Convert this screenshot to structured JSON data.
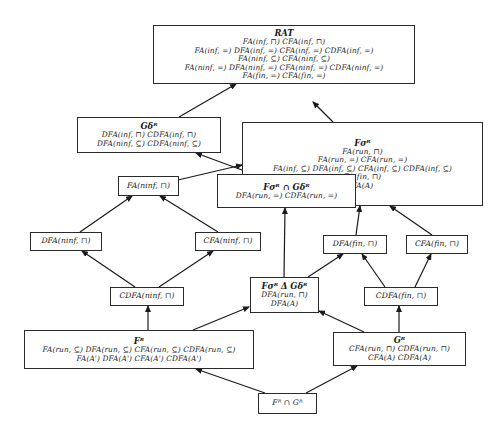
{
  "diagram": {
    "type": "hasse-inclusion-lattice",
    "nodes": [
      {
        "id": "rat",
        "title": "RAT",
        "lines": [
          "FA(inf, ⊓) CFA(inf, ⊓)",
          "FA(inf, =) DFA(inf, =) CFA(inf, =) CDFA(inf, =)",
          "FA(ninf, ⊆) CFA(ninf, ⊆)",
          "FA(ninf, =) DFA(ninf, =) CFA(ninf, =) CDFA(ninf, =)",
          "FA(fin, =) CFA(fin, =)"
        ]
      },
      {
        "id": "g-delta",
        "title": "Gδᴿ",
        "lines": [
          "DFA(inf, ⊓) CDFA(inf, ⊓)",
          "DFA(ninf, ⊆) CDFA(ninf, ⊆)"
        ]
      },
      {
        "id": "f-sigma",
        "title": "Fσᴿ",
        "lines": [
          "FA(run, ⊓)",
          "FA(run, =) CFA(run, =)",
          "FA(inf, ⊆) DFA(inf, ⊆) CFA(inf, ⊆) CDFA(inf, ⊆)",
          "FA(fin, ⊓)",
          "FA(A)"
        ]
      },
      {
        "id": "fa-ninf-meet",
        "title": "",
        "lines": [
          "FA(ninf, ⊓)"
        ]
      },
      {
        "id": "f-sigma-cap-g-delta",
        "title": "Fσᴿ ∩ Gδᴿ",
        "lines": [
          "DFA(run, =) CDFA(run, =)"
        ]
      },
      {
        "id": "dfa-ninf-meet",
        "title": "",
        "lines": [
          "DFA(ninf, ⊓)"
        ]
      },
      {
        "id": "cfa-ninf-meet",
        "title": "",
        "lines": [
          "CFA(ninf, ⊓)"
        ]
      },
      {
        "id": "dfa-fin-meet",
        "title": "",
        "lines": [
          "DFA(fin, ⊓)"
        ]
      },
      {
        "id": "cfa-fin-meet",
        "title": "",
        "lines": [
          "CFA(fin, ⊓)"
        ]
      },
      {
        "id": "cdfa-ninf-meet",
        "title": "",
        "lines": [
          "CDFA(ninf, ⊓)"
        ]
      },
      {
        "id": "f-sigma-delta-g-delta",
        "title": "Fσᴿ Δ Gδᴿ",
        "lines": [
          "DFA(run, ⊓)",
          "DFA(A)"
        ]
      },
      {
        "id": "cdfa-fin-meet",
        "title": "",
        "lines": [
          "CDFA(fin, ⊓)"
        ]
      },
      {
        "id": "f-r",
        "title": "Fᴿ",
        "lines": [
          "FA(run, ⊆) DFA(run, ⊆) CFA(run, ⊆) CDFA(run, ⊆)",
          "FA(A') DFA(A') CFA(A') CDFA(A')"
        ]
      },
      {
        "id": "g-r",
        "title": "Gᴿ",
        "lines": [
          "CFA(run, ⊓) CDFA(run, ⊓)",
          "CFA(A) CDFA(A)"
        ]
      },
      {
        "id": "f-r-cap-g-r",
        "title": "",
        "lines": [
          "Fᴿ ∩ Gᴿ"
        ]
      }
    ],
    "edges": [
      {
        "from": "g-delta",
        "to": "rat"
      },
      {
        "from": "f-sigma",
        "to": "rat"
      },
      {
        "from": "f-sigma",
        "to": "g-delta"
      },
      {
        "from": "fa-ninf-meet",
        "to": "f-sigma"
      },
      {
        "from": "f-sigma-cap-g-delta",
        "to": "f-sigma"
      },
      {
        "from": "f-sigma-cap-g-delta",
        "to": "g-delta"
      },
      {
        "from": "dfa-ninf-meet",
        "to": "fa-ninf-meet"
      },
      {
        "from": "cfa-ninf-meet",
        "to": "fa-ninf-meet"
      },
      {
        "from": "dfa-fin-meet",
        "to": "f-sigma"
      },
      {
        "from": "cfa-fin-meet",
        "to": "f-sigma"
      },
      {
        "from": "cdfa-ninf-meet",
        "to": "dfa-ninf-meet"
      },
      {
        "from": "cdfa-ninf-meet",
        "to": "cfa-ninf-meet"
      },
      {
        "from": "f-sigma-delta-g-delta",
        "to": "f-sigma-cap-g-delta"
      },
      {
        "from": "f-sigma-delta-g-delta",
        "to": "dfa-fin-meet"
      },
      {
        "from": "cdfa-fin-meet",
        "to": "dfa-fin-meet"
      },
      {
        "from": "cdfa-fin-meet",
        "to": "cfa-fin-meet"
      },
      {
        "from": "f-r",
        "to": "cdfa-ninf-meet"
      },
      {
        "from": "f-r",
        "to": "f-sigma-delta-g-delta"
      },
      {
        "from": "g-r",
        "to": "f-sigma-delta-g-delta"
      },
      {
        "from": "g-r",
        "to": "cdfa-fin-meet"
      },
      {
        "from": "f-r-cap-g-r",
        "to": "f-r"
      },
      {
        "from": "f-r-cap-g-r",
        "to": "g-r"
      }
    ]
  }
}
